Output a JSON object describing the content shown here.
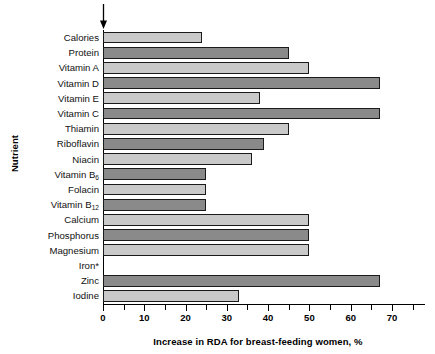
{
  "chart_data": {
    "type": "bar",
    "orientation": "horizontal",
    "title": "",
    "xlabel": "Increase in RDA for breast-feeding women, %",
    "ylabel": "Nutrient",
    "xlim": [
      0,
      78
    ],
    "xticks": [
      0,
      5,
      10,
      15,
      20,
      25,
      30,
      35,
      40,
      45,
      50,
      55,
      60,
      65,
      70,
      75
    ],
    "xtick_labels": [
      "0",
      "10",
      "20",
      "30",
      "40",
      "50",
      "60",
      "70"
    ],
    "xtick_label_values": [
      0,
      10,
      20,
      30,
      40,
      50,
      60,
      70
    ],
    "grid": false,
    "legend": null,
    "categories": [
      "Calories",
      "Protein",
      "Vitamin A",
      "Vitamin D",
      "Vitamin E",
      "Vitamin C",
      "Thiamin",
      "Riboflavin",
      "Niacin",
      "Vitamin B6",
      "Folacin",
      "Vitamin B12",
      "Calcium",
      "Phosphorus",
      "Magnesium",
      "Iron*",
      "Zinc",
      "Iodine"
    ],
    "values": [
      24,
      45,
      50,
      67,
      38,
      67,
      45,
      39,
      36,
      25,
      25,
      25,
      50,
      50,
      50,
      0,
      67,
      33
    ],
    "bars": [
      {
        "label": "Calories",
        "label_html": "Calories",
        "value": 24,
        "shade": "light"
      },
      {
        "label": "Protein",
        "label_html": "Protein",
        "value": 45,
        "shade": "dark"
      },
      {
        "label": "Vitamin A",
        "label_html": "Vitamin A",
        "value": 50,
        "shade": "light"
      },
      {
        "label": "Vitamin D",
        "label_html": "Vitamin D",
        "value": 67,
        "shade": "dark"
      },
      {
        "label": "Vitamin E",
        "label_html": "Vitamin E",
        "value": 38,
        "shade": "light"
      },
      {
        "label": "Vitamin C",
        "label_html": "Vitamin C",
        "value": 67,
        "shade": "dark"
      },
      {
        "label": "Thiamin",
        "label_html": "Thiamin",
        "value": 45,
        "shade": "light"
      },
      {
        "label": "Riboflavin",
        "label_html": "Riboflavin",
        "value": 39,
        "shade": "dark"
      },
      {
        "label": "Niacin",
        "label_html": "Niacin",
        "value": 36,
        "shade": "light"
      },
      {
        "label": "Vitamin B6",
        "label_html": "Vitamin B<sub>6</sub>",
        "value": 25,
        "shade": "dark"
      },
      {
        "label": "Folacin",
        "label_html": "Folacin",
        "value": 25,
        "shade": "light"
      },
      {
        "label": "Vitamin B12",
        "label_html": "Vitamin B<sub>12</sub>",
        "value": 25,
        "shade": "dark"
      },
      {
        "label": "Calcium",
        "label_html": "Calcium",
        "value": 50,
        "shade": "light"
      },
      {
        "label": "Phosphorus",
        "label_html": "Phosphorus",
        "value": 50,
        "shade": "dark"
      },
      {
        "label": "Magnesium",
        "label_html": "Magnesium",
        "value": 50,
        "shade": "light"
      },
      {
        "label": "Iron*",
        "label_html": "Iron*",
        "value": 0,
        "shade": "light"
      },
      {
        "label": "Zinc",
        "label_html": "Zinc",
        "value": 67,
        "shade": "dark"
      },
      {
        "label": "Iodine",
        "label_html": "Iodine",
        "value": 33,
        "shade": "light"
      }
    ],
    "annotations": [
      {
        "name": "top-arrow",
        "type": "down-arrow",
        "at_value": 0,
        "note": ""
      }
    ],
    "colors": {
      "bar_light": "#c9c9c9",
      "bar_dark": "#8a8a8a",
      "bar_outline": "#1a1a1a",
      "axis": "#000000",
      "text": "#000000",
      "background": "#ffffff"
    }
  }
}
